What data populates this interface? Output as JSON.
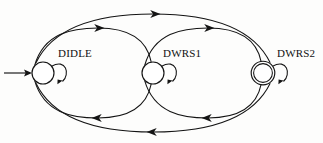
{
  "diagram": {
    "background_color": "#fdfdfc",
    "stroke_color": "#141414",
    "states": [
      {
        "id": "DIDLE",
        "label": "DIDLE",
        "cx": 43,
        "cy": 73,
        "r": 11,
        "accepting": false,
        "initial": true,
        "label_x": 58,
        "label_y": 57
      },
      {
        "id": "DWRS1",
        "label": "DWRS1",
        "cx": 153,
        "cy": 73,
        "r": 11,
        "accepting": false,
        "initial": false,
        "label_x": 163,
        "label_y": 57
      },
      {
        "id": "DWRS2",
        "label": "DWRS2",
        "cx": 263,
        "cy": 73,
        "r": 11,
        "accepting": true,
        "initial": false,
        "label_x": 277,
        "label_y": 57
      }
    ],
    "transitions": [
      {
        "from": "start",
        "to": "DIDLE",
        "kind": "initial-arrow"
      },
      {
        "from": "DIDLE",
        "to": "DIDLE",
        "kind": "self-loop"
      },
      {
        "from": "DWRS1",
        "to": "DWRS1",
        "kind": "self-loop"
      },
      {
        "from": "DWRS2",
        "to": "DWRS2",
        "kind": "self-loop"
      },
      {
        "from": "DIDLE",
        "to": "DWRS1",
        "kind": "arc-above"
      },
      {
        "from": "DWRS1",
        "to": "DWRS2",
        "kind": "arc-above"
      },
      {
        "from": "DIDLE",
        "to": "DWRS2",
        "kind": "arc-above-outer"
      },
      {
        "from": "DWRS1",
        "to": "DIDLE",
        "kind": "arc-below"
      },
      {
        "from": "DWRS2",
        "to": "DWRS1",
        "kind": "arc-below"
      },
      {
        "from": "DWRS2",
        "to": "DIDLE",
        "kind": "arc-below-outer"
      }
    ]
  }
}
